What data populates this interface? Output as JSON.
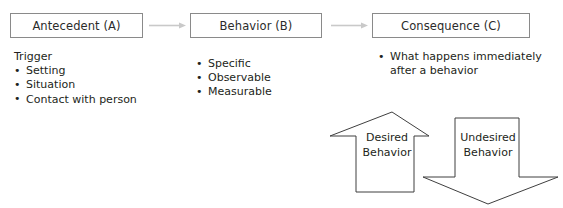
{
  "diagram": {
    "stroke_color": "#8a8a8a",
    "arrow_outline_color": "#3a3a3a",
    "text_color": "#231f20",
    "flow": [
      {
        "id": "antecedent",
        "box_label": "Antecedent (A)",
        "heading": "Trigger",
        "bullets": [
          "Setting",
          "Situation",
          "Contact with person"
        ]
      },
      {
        "id": "behavior",
        "box_label": "Behavior (B)",
        "heading": "",
        "bullets": [
          "Specific",
          "Observable",
          "Measurable"
        ]
      },
      {
        "id": "consequence",
        "box_label": "Consequence (C)",
        "heading": "",
        "bullets": [
          "What happens immediately after a behavior"
        ]
      }
    ],
    "connectors": [
      {
        "id": "antecedent-to-behavior",
        "direction": "right"
      },
      {
        "id": "behavior-to-consequence",
        "direction": "right"
      }
    ],
    "block_arrows": [
      {
        "id": "desired",
        "direction": "up",
        "label_line1": "Desired",
        "label_line2": "Behavior"
      },
      {
        "id": "undesired",
        "direction": "down",
        "label_line1": "Undesired",
        "label_line2": "Behavior"
      }
    ]
  }
}
